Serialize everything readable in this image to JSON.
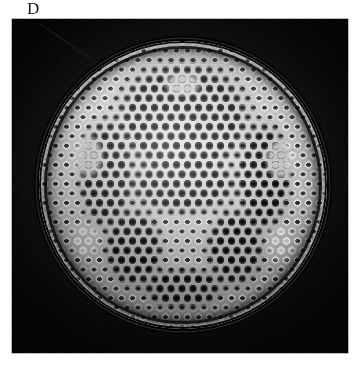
{
  "figure": {
    "panel_label": "D",
    "caption": "",
    "modality": "light micrograph",
    "background_color": "#ffffff",
    "plate_color": "#0a0a0a",
    "specimen_color": "#c8c8c8"
  },
  "micrograph": {
    "name": "specimen-micrograph",
    "alt": "dark-field photomicrograph of a round porous silica disc",
    "plate": {
      "left": 12,
      "top": 19,
      "width": 336,
      "height": 334
    }
  },
  "specimen": {
    "name": "specimen-disc",
    "shape": "circular",
    "diameter_px": 288,
    "center_x": 171,
    "center_y": 166,
    "rim": {
      "name": "disc-rim-ring",
      "color": "#0a0a0a"
    },
    "features": [
      {
        "name": "hexagonal-pore-lattice",
        "description": "close-packed hexagonal array of areolae across the valve face"
      },
      {
        "name": "dark-pore-clusters",
        "description": "groups of dark-filled pores forming broad arcs and a central rosette"
      },
      {
        "name": "bright-pore-clusters",
        "description": "small clusters of brightly lit pores flanking the central band"
      },
      {
        "name": "marginal-striae",
        "description": "radially elongated elongate cells in the peripheral annulus"
      },
      {
        "name": "outer-margin-ring",
        "description": "thick dark ring bounding the valve margin"
      }
    ]
  },
  "artifacts": [
    {
      "name": "scratch-streak-upper-left"
    },
    {
      "name": "scratch-streak-right"
    },
    {
      "name": "emulsion-grain"
    }
  ]
}
